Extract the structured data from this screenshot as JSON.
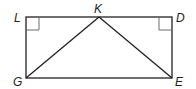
{
  "diagram": {
    "type": "geometry",
    "shape": "rectangle LDEG with triangle GKE",
    "points": {
      "L": {
        "label": "L",
        "x": 26,
        "y": 17
      },
      "K": {
        "label": "K",
        "x": 99,
        "y": 17
      },
      "D": {
        "label": "D",
        "x": 172,
        "y": 17
      },
      "G": {
        "label": "G",
        "x": 26,
        "y": 78
      },
      "E": {
        "label": "E",
        "x": 172,
        "y": 78
      }
    },
    "segments": [
      "LD",
      "DE",
      "EG",
      "GL",
      "GK",
      "KE"
    ],
    "right_angle_markers": [
      "L",
      "D"
    ],
    "colors": {
      "stroke": "#231f20",
      "marker": "#555555",
      "background": "#ffffff"
    }
  }
}
